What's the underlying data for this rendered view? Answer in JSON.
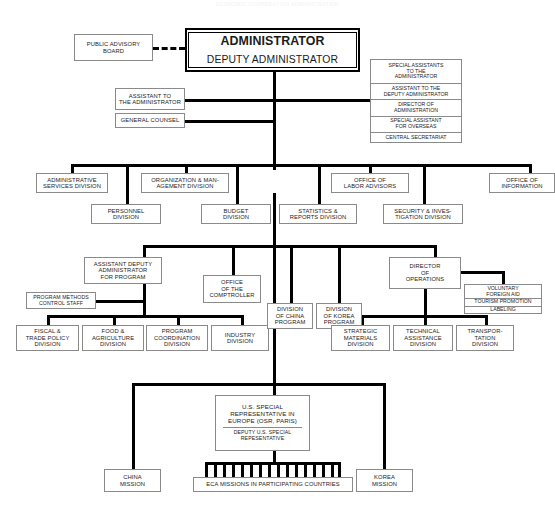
{
  "document": {
    "title_faint": "ECONOMIC COOPERATION ADMINISTRATION"
  },
  "nodes": {
    "public_advisory_board": {
      "lines": [
        "PUBLIC ADVISORY",
        "BOARD"
      ]
    },
    "administrator": {
      "line1": "ADMINISTRATOR",
      "line2": "DEPUTY ADMINISTRATOR"
    },
    "assistant_to_administrator": {
      "lines": [
        "ASSISTANT TO",
        "THE ADMINISTRATOR"
      ]
    },
    "general_counsel": {
      "lines": [
        "GENERAL COUNSEL"
      ]
    },
    "special_assistants_stack": {
      "cells": [
        {
          "lines": [
            "SPECIAL ASSISTANTS",
            "TO  THE",
            "ADMINISTRATOR"
          ]
        },
        {
          "lines": [
            "ASSISTANT  TO  THE",
            "DEPUTY  ADMINISTRATOR"
          ]
        },
        {
          "lines": [
            "DIRECTOR  OF",
            "ADMINISTRATION"
          ]
        },
        {
          "lines": [
            "SPECIAL  ASSISTANT",
            "FOR  OVERSEAS"
          ]
        },
        {
          "lines": [
            "CENTRAL  SECRETARIAT"
          ]
        }
      ]
    },
    "administrative_services_division": {
      "lines": [
        "ADMINISTRATIVE",
        "SERVICES DIVISION"
      ]
    },
    "personnel_division": {
      "lines": [
        "PERSONNEL",
        "DIVISION"
      ]
    },
    "organization_management_division": {
      "lines": [
        "ORGANIZATION &  MAN-",
        "AGEMENT DIVISION"
      ]
    },
    "budget_division": {
      "lines": [
        "BUDGET",
        "DIVISION"
      ]
    },
    "statistics_reports_division": {
      "lines": [
        "STATISTICS &",
        "REPORTS DIVISION"
      ]
    },
    "office_of_labor_advisors": {
      "lines": [
        "OFFICE OF",
        "LABOR ADVISORS"
      ]
    },
    "security_investigation_division": {
      "lines": [
        "SECURITY & INVES-",
        "TIGATION DIVISION"
      ]
    },
    "office_of_information": {
      "lines": [
        "OFFICE OF",
        "INFORMATION"
      ]
    },
    "assistant_deputy_administrator_program": {
      "lines": [
        "ASSISTANT DEPUTY",
        "ADMINISTRATOR",
        "FOR  PROGRAM"
      ]
    },
    "program_methods_control_staff": {
      "lines": [
        "PROGRAM METHODS",
        "CONTROL STAFF"
      ]
    },
    "office_of_comptroller": {
      "lines": [
        "OFFICE",
        "OF  THE",
        "COMPTROLLER"
      ]
    },
    "division_of_china_program": {
      "lines": [
        "DIVISION",
        "OF CHINA",
        "PROGRAM"
      ]
    },
    "division_of_korea_program": {
      "lines": [
        "DIVISION",
        "OF  KOREA",
        "PROGRAM"
      ]
    },
    "director_of_operations": {
      "lines": [
        "DIRECTOR",
        "OF",
        "OPERATIONS"
      ]
    },
    "voluntary_aid_stack": {
      "cells": [
        {
          "lines": [
            "VOLUNTARY",
            "FOREIGN  AID"
          ]
        },
        {
          "lines": [
            "TOURISM  PROMOTION"
          ]
        },
        {
          "lines": [
            "LABELING"
          ]
        }
      ]
    },
    "fiscal_trade_policy_division": {
      "lines": [
        "FISCAL  &",
        "TRADE  POLICY",
        "DIVISION"
      ]
    },
    "food_agriculture_division": {
      "lines": [
        "FOOD  &",
        "AGRICULTURE",
        "DIVISION"
      ]
    },
    "program_coordination_division": {
      "lines": [
        "PROGRAM",
        "COORDINATION",
        "DIVISION"
      ]
    },
    "industry_division": {
      "lines": [
        "INDUSTRY",
        "DIVISION"
      ]
    },
    "strategic_materials_division": {
      "lines": [
        "STRATEGIC",
        "MATERIALS",
        "DIVISION"
      ]
    },
    "technical_assistance_division": {
      "lines": [
        "TECHNICAL",
        "ASSISTANCE",
        "DIVISION"
      ]
    },
    "transportation_division": {
      "lines": [
        "TRANSPOR-",
        "TATION",
        "DIVISION"
      ]
    },
    "us_special_representative": {
      "top": [
        "U.S.  SPECIAL",
        "REPRESENTATIVE  IN",
        "EUROPE  (OSR, PARIS)"
      ],
      "bottom": [
        "DEPUTY  U.S. SPECIAL",
        "REPESENTATIVE"
      ]
    },
    "china_mission": {
      "lines": [
        "CHINA",
        "MISSION"
      ]
    },
    "korea_mission": {
      "lines": [
        "KOREA",
        "MISSION"
      ]
    },
    "eca_missions": {
      "lines": [
        "ECA  MISSIONS  IN  PARTICIPATING  COUNTRIES"
      ],
      "teeth": 16
    }
  },
  "colors": {
    "line": "#000000",
    "box_border": "#8a8a8a",
    "root_border": "#000000",
    "text": "#1b1b1b",
    "background": "#ffffff"
  }
}
